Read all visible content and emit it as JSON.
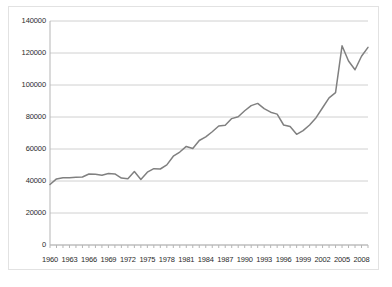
{
  "chart_data": {
    "type": "line",
    "title": "",
    "subtitle": "",
    "xlabel": "",
    "ylabel": "",
    "grid": "horizontal",
    "legend": "none",
    "xlim": [
      1960,
      2009
    ],
    "ylim": [
      0,
      140000
    ],
    "ytick_labels": [
      "0",
      "20000",
      "40000",
      "60000",
      "80000",
      "100000",
      "120000",
      "140000"
    ],
    "ytick_values": [
      0,
      20000,
      40000,
      60000,
      80000,
      100000,
      120000,
      140000
    ],
    "xtick_labels": [
      "1960",
      "1963",
      "1966",
      "1969",
      "1972",
      "1975",
      "1978",
      "1981",
      "1984",
      "1987",
      "1990",
      "1993",
      "1996",
      "1999",
      "2002",
      "2005",
      "2008"
    ],
    "xtick_values": [
      1960,
      1963,
      1966,
      1969,
      1972,
      1975,
      1978,
      1981,
      1984,
      1987,
      1990,
      1993,
      1996,
      1999,
      2002,
      2005,
      2008
    ],
    "x": [
      1960,
      1961,
      1962,
      1963,
      1964,
      1965,
      1966,
      1967,
      1968,
      1969,
      1970,
      1971,
      1972,
      1973,
      1974,
      1975,
      1976,
      1977,
      1978,
      1979,
      1980,
      1981,
      1982,
      1983,
      1984,
      1985,
      1986,
      1987,
      1988,
      1989,
      1990,
      1991,
      1992,
      1993,
      1994,
      1995,
      1996,
      1997,
      1998,
      1999,
      2000,
      2001,
      2002,
      2003,
      2004,
      2005,
      2006,
      2007,
      2008,
      2009
    ],
    "series": [
      {
        "name": "value",
        "color": "#808080",
        "values": [
          37800,
          41300,
          42000,
          42100,
          42300,
          42500,
          44400,
          44200,
          43600,
          44700,
          44400,
          41800,
          41400,
          45900,
          41000,
          45500,
          47700,
          47500,
          50100,
          55500,
          58100,
          61600,
          60300,
          65300,
          67600,
          70800,
          74400,
          74800,
          79000,
          80200,
          83900,
          87100,
          88500,
          85200,
          83000,
          81800,
          75000,
          74000,
          69200,
          71500,
          75000,
          79600,
          85800,
          92000,
          95200,
          124500,
          115000,
          109500,
          118000,
          123500
        ]
      }
    ]
  }
}
